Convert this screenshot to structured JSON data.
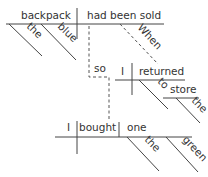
{
  "diagram": {
    "type": "Reed-Kellogg sentence diagram",
    "clause1": {
      "subject": "backpack",
      "verb": "had been sold",
      "subject_modifiers": [
        "the",
        "blue"
      ],
      "verb_modifier": "When"
    },
    "conjunction": "so",
    "clause2": {
      "subject": "I",
      "verb": "returned",
      "preposition": "to",
      "object_of_preposition": "store",
      "object_modifier": "the"
    },
    "clause3": {
      "subject": "I",
      "verb": "bought",
      "direct_object": "one",
      "object_modifiers": [
        "the",
        "green"
      ]
    }
  }
}
